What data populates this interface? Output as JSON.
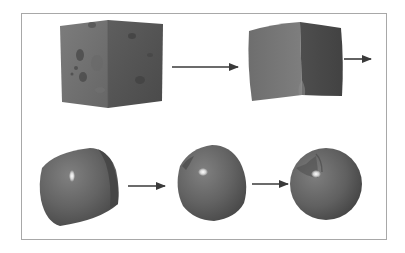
{
  "figure": {
    "frame_color": "#a8a8a8",
    "arrow_color": "#3a3a3a",
    "shapes": [
      {
        "id": "stage-1",
        "kind": "textured-cube",
        "label": ""
      },
      {
        "id": "stage-2",
        "kind": "slightly-deformed-cube",
        "label": ""
      },
      {
        "id": "stage-3",
        "kind": "rounded-cube",
        "label": ""
      },
      {
        "id": "stage-4",
        "kind": "rounded-blob",
        "label": ""
      },
      {
        "id": "stage-5",
        "kind": "sphere",
        "label": ""
      }
    ],
    "arrows": [
      {
        "from": "stage-1",
        "to": "stage-2"
      },
      {
        "from": "stage-2",
        "to": "stage-3"
      },
      {
        "from": "stage-3",
        "to": "stage-4"
      },
      {
        "from": "stage-4",
        "to": "stage-5"
      }
    ],
    "colors": {
      "surface_light": "#7a7a7a",
      "surface_mid": "#626262",
      "surface_dark": "#474747",
      "spot_dark": "#4c4c4c",
      "highlight": "#ffffff"
    }
  }
}
